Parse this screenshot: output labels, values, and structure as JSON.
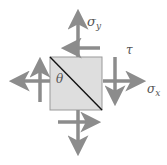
{
  "diagram": {
    "type": "stress-element",
    "labels": {
      "sigma_y": "σ",
      "sigma_y_sub": "y",
      "tau": "τ",
      "sigma_x": "σ",
      "sigma_x_sub": "x",
      "theta": "θ"
    },
    "colors": {
      "arrow": "#8c8c8c",
      "element_fill": "#dedede",
      "element_border": "#9a9a9a",
      "diagonal": "#111111",
      "label": "#555555"
    }
  }
}
